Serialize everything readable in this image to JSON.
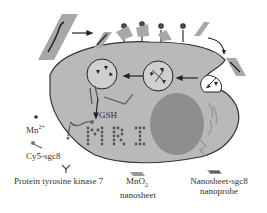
{
  "diagram": {
    "cell_color": "#b9b9b9",
    "nucleus_color": "#8e8e8e",
    "outline_color": "#333333",
    "sheet_color": "#a8a8a8",
    "cell_labels": {
      "gsh": "GSH",
      "mri": "MRI"
    },
    "legend": {
      "mn": {
        "base": "Mn",
        "sup": "2+"
      },
      "cy5": "Cy5-sgc8",
      "ptk7": "Protein tyrosine kinase 7",
      "mno2_line1_base": "MnO",
      "mno2_line1_sub": "2",
      "mno2_line2": "nanosheet",
      "probe_line1": "Nanosheet-sgc8",
      "probe_line2": "nanoprobe"
    }
  }
}
